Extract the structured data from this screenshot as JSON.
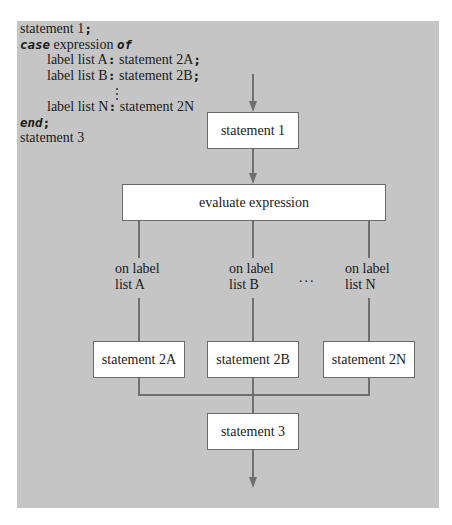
{
  "code": {
    "line1": "statement 1",
    "line2_kw": "case",
    "line2_text": " expression ",
    "line2_kw2": "of",
    "line3_label": "label list A",
    "line3_stmt": " statement 2A",
    "line4_label": "label list B",
    "line4_stmt": " statement 2B",
    "line5_label": "label list N",
    "line5_stmt": " statement 2N",
    "line6_kw": "end",
    "line7": "statement 3",
    "semicolon": ";",
    "colon": ":"
  },
  "flowchart": {
    "statement1": "statement 1",
    "evaluate": "evaluate expression",
    "branches": [
      {
        "line1": "on label",
        "line2": "list A",
        "box": "statement 2A"
      },
      {
        "line1": "on label",
        "line2": "list B",
        "box": "statement 2B"
      },
      {
        "line1": "on label",
        "line2": "list N",
        "box": "statement 2N"
      }
    ],
    "ellipsis": "...",
    "statement3": "statement 3"
  },
  "colors": {
    "panel": "#c5c5c5",
    "lines": "#6f6f6f",
    "box_fill": "#ffffff"
  }
}
